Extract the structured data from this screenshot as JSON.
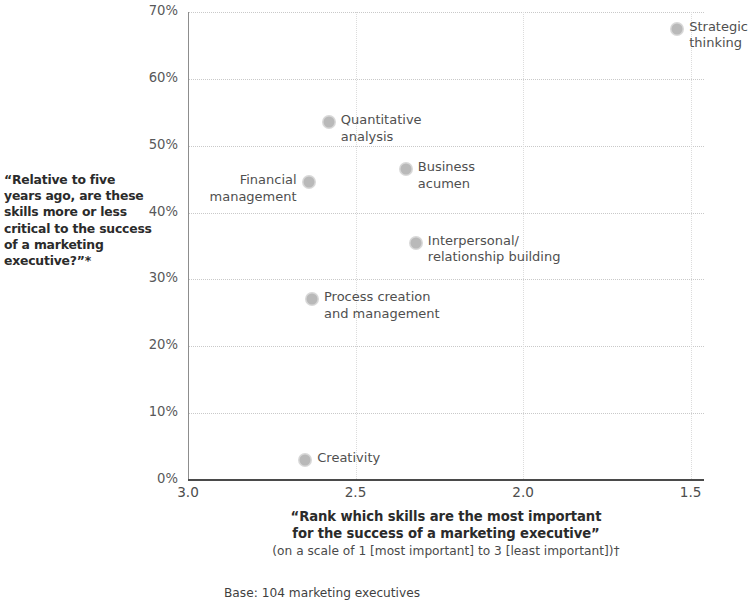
{
  "chart_data": {
    "type": "scatter",
    "title": "",
    "xlabel": "“Rank which skills are the most important for the success of a marketing executive”",
    "xlabel_line1": "“Rank which skills are the most important",
    "xlabel_line2": "for the success of a marketing executive”",
    "xlabel_sub": "(on a scale of 1 [most important] to 3 [least important])†",
    "ylabel": "“Relative to five years ago, are these skills more or less critical to the success of a marketing executive?”*",
    "base_note": "Base: 104 marketing executives",
    "xlim": [
      3.0,
      1.46
    ],
    "ylim": [
      0,
      70
    ],
    "x_ticks": [
      "3.0",
      "2.5",
      "2.0",
      "1.5"
    ],
    "x_tick_values": [
      3.0,
      2.5,
      2.0,
      1.5
    ],
    "y_ticks": [
      "0%",
      "10%",
      "20%",
      "30%",
      "40%",
      "50%",
      "60%",
      "70%"
    ],
    "y_tick_values": [
      0,
      10,
      20,
      30,
      40,
      50,
      60,
      70
    ],
    "grid": "dotted",
    "legend": "none",
    "marker_color": "#b9b9b9",
    "points": [
      {
        "label": "Strategic\nthinking",
        "x": 1.54,
        "y": 67.5,
        "label_side": "right"
      },
      {
        "label": "Quantitative\nanalysis",
        "x": 2.58,
        "y": 53.5,
        "label_side": "right"
      },
      {
        "label": "Business\nacumen",
        "x": 2.35,
        "y": 46.5,
        "label_side": "right"
      },
      {
        "label": "Financial\nmanagement",
        "x": 2.64,
        "y": 44.5,
        "label_side": "left"
      },
      {
        "label": "Interpersonal/\nrelationship building",
        "x": 2.32,
        "y": 35.5,
        "label_side": "right"
      },
      {
        "label": "Process creation\nand management",
        "x": 2.63,
        "y": 27.0,
        "label_side": "right"
      },
      {
        "label": "Creativity",
        "x": 2.65,
        "y": 3.0,
        "label_side": "right"
      }
    ]
  }
}
